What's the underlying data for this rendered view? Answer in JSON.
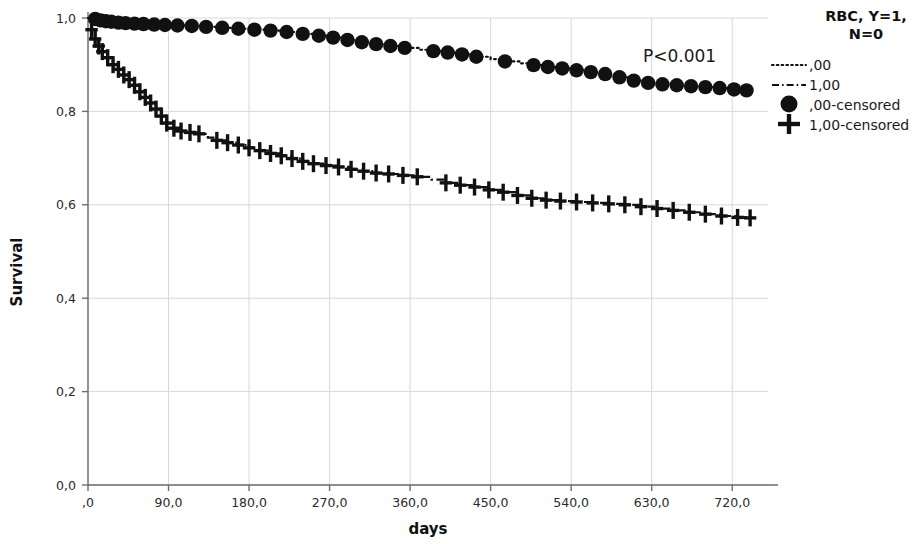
{
  "chart_data": {
    "type": "line",
    "title": "",
    "xlabel": "days",
    "ylabel": "Survival",
    "xlim": [
      0,
      760
    ],
    "ylim": [
      0.0,
      1.0
    ],
    "grid": true,
    "legend_position": "right",
    "legend_title": "RBC, Y=1, N=0",
    "annotations": [
      {
        "text": "P<0.001",
        "x": 600,
        "y": 0.905
      }
    ],
    "xticks": [
      0,
      90,
      180,
      270,
      360,
      450,
      540,
      630,
      720
    ],
    "xtick_labels": [
      ",0",
      "90,0",
      "180,0",
      "270,0",
      "360,0",
      "450,0",
      "540,0",
      "630,0",
      "720,0"
    ],
    "yticks": [
      0.0,
      0.2,
      0.4,
      0.6,
      0.8,
      1.0
    ],
    "ytick_labels": [
      "0,0",
      "0,2",
      "0,4",
      "0,6",
      "0,8",
      "1,0"
    ],
    "series": [
      {
        "name": ",00",
        "style": "dotted",
        "censor_marker": "circle",
        "censor_label": ",00-censored",
        "x": [
          0,
          8,
          14,
          20,
          26,
          34,
          42,
          52,
          62,
          74,
          86,
          100,
          116,
          132,
          150,
          168,
          186,
          204,
          222,
          240,
          258,
          274,
          290,
          306,
          322,
          338,
          354,
          370,
          386,
          402,
          418,
          434,
          450,
          466,
          482,
          498,
          514,
          530,
          546,
          562,
          578,
          594,
          610,
          626,
          642,
          658,
          674,
          690,
          706,
          722,
          736
        ],
        "y": [
          1.0,
          0.998,
          0.995,
          0.993,
          0.992,
          0.99,
          0.989,
          0.988,
          0.987,
          0.986,
          0.985,
          0.984,
          0.983,
          0.981,
          0.979,
          0.977,
          0.975,
          0.973,
          0.97,
          0.966,
          0.962,
          0.958,
          0.953,
          0.948,
          0.944,
          0.94,
          0.936,
          0.932,
          0.929,
          0.926,
          0.922,
          0.917,
          0.912,
          0.907,
          0.903,
          0.899,
          0.895,
          0.892,
          0.888,
          0.884,
          0.88,
          0.873,
          0.866,
          0.861,
          0.858,
          0.856,
          0.854,
          0.852,
          0.85,
          0.847,
          0.845
        ],
        "censor_x": [
          8,
          14,
          20,
          26,
          34,
          42,
          52,
          62,
          74,
          86,
          100,
          116,
          132,
          150,
          168,
          186,
          204,
          222,
          240,
          258,
          274,
          290,
          306,
          322,
          338,
          354,
          386,
          402,
          418,
          434,
          466,
          498,
          514,
          530,
          546,
          562,
          578,
          594,
          610,
          626,
          642,
          658,
          674,
          690,
          706,
          722,
          736
        ],
        "censor_y": [
          0.998,
          0.995,
          0.993,
          0.992,
          0.99,
          0.989,
          0.988,
          0.987,
          0.986,
          0.985,
          0.984,
          0.983,
          0.981,
          0.979,
          0.977,
          0.975,
          0.973,
          0.97,
          0.966,
          0.962,
          0.958,
          0.953,
          0.948,
          0.944,
          0.94,
          0.936,
          0.929,
          0.926,
          0.922,
          0.917,
          0.907,
          0.899,
          0.895,
          0.892,
          0.888,
          0.884,
          0.88,
          0.873,
          0.866,
          0.861,
          0.858,
          0.856,
          0.854,
          0.852,
          0.85,
          0.847,
          0.845
        ]
      },
      {
        "name": "1,00",
        "style": "dashdot",
        "censor_marker": "plus",
        "censor_label": "1,00-censored",
        "x": [
          0,
          4,
          8,
          12,
          16,
          22,
          28,
          34,
          40,
          46,
          52,
          58,
          64,
          70,
          76,
          82,
          88,
          96,
          104,
          114,
          124,
          134,
          144,
          156,
          168,
          180,
          192,
          204,
          216,
          228,
          240,
          252,
          266,
          280,
          294,
          308,
          322,
          336,
          352,
          368,
          384,
          400,
          416,
          432,
          448,
          464,
          480,
          496,
          512,
          528,
          546,
          564,
          582,
          600,
          618,
          636,
          654,
          672,
          690,
          708,
          726,
          740
        ],
        "y": [
          1.0,
          0.975,
          0.955,
          0.94,
          0.928,
          0.915,
          0.9,
          0.89,
          0.878,
          0.868,
          0.856,
          0.842,
          0.83,
          0.818,
          0.805,
          0.79,
          0.775,
          0.764,
          0.758,
          0.755,
          0.752,
          0.744,
          0.738,
          0.733,
          0.728,
          0.722,
          0.716,
          0.71,
          0.705,
          0.699,
          0.693,
          0.688,
          0.684,
          0.681,
          0.676,
          0.672,
          0.668,
          0.666,
          0.663,
          0.66,
          0.654,
          0.647,
          0.642,
          0.638,
          0.632,
          0.627,
          0.62,
          0.614,
          0.61,
          0.608,
          0.606,
          0.604,
          0.602,
          0.6,
          0.596,
          0.592,
          0.588,
          0.584,
          0.58,
          0.576,
          0.573,
          0.572
        ],
        "censor_x": [
          4,
          8,
          12,
          16,
          22,
          28,
          34,
          40,
          46,
          52,
          58,
          64,
          70,
          76,
          82,
          88,
          96,
          104,
          114,
          124,
          144,
          156,
          168,
          180,
          192,
          204,
          216,
          228,
          240,
          252,
          266,
          280,
          294,
          308,
          322,
          336,
          352,
          368,
          400,
          416,
          432,
          448,
          464,
          480,
          496,
          512,
          528,
          546,
          564,
          582,
          600,
          618,
          636,
          654,
          672,
          690,
          708,
          726,
          740
        ],
        "censor_y": [
          0.975,
          0.955,
          0.94,
          0.928,
          0.915,
          0.9,
          0.89,
          0.878,
          0.868,
          0.856,
          0.842,
          0.83,
          0.818,
          0.805,
          0.79,
          0.775,
          0.764,
          0.758,
          0.755,
          0.752,
          0.738,
          0.733,
          0.728,
          0.722,
          0.716,
          0.71,
          0.705,
          0.699,
          0.693,
          0.688,
          0.684,
          0.681,
          0.676,
          0.672,
          0.668,
          0.666,
          0.663,
          0.66,
          0.647,
          0.642,
          0.638,
          0.632,
          0.627,
          0.62,
          0.614,
          0.61,
          0.608,
          0.606,
          0.604,
          0.602,
          0.6,
          0.596,
          0.592,
          0.588,
          0.584,
          0.58,
          0.576,
          0.573,
          0.572
        ]
      }
    ]
  },
  "legend": {
    "title_line1": "RBC, Y=1,",
    "title_line2": "N=0",
    "entries": [
      {
        "label": ",00",
        "marker": "dotted-line"
      },
      {
        "label": "1,00",
        "marker": "dashdot-line"
      },
      {
        "label": ",00-censored",
        "marker": "filled-circle"
      },
      {
        "label": "1,00-censored",
        "marker": "plus-sign"
      }
    ]
  },
  "annotation": {
    "pvalue": "P<0.001"
  },
  "axes": {
    "x_title": "days",
    "y_title": "Survival"
  },
  "colors": {
    "ink": "#111111",
    "grid": "#d8d8d8",
    "axis": "#6e6e6e",
    "background": "#ffffff"
  }
}
